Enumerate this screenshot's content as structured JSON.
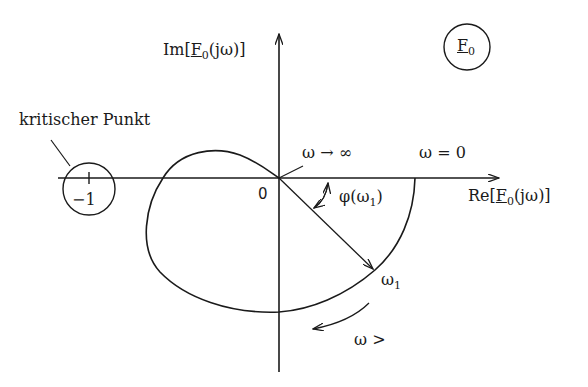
{
  "diagram": {
    "title_symbol": {
      "main": "F",
      "sub": "0"
    },
    "axes": {
      "imag_label": {
        "prefix": "Im[",
        "F": "F",
        "sub": "0",
        "suffix": "(jω)]"
      },
      "real_label": {
        "prefix": "Re[",
        "F": "F",
        "sub": "0",
        "suffix": "(jω)]"
      },
      "origin_label": "0"
    },
    "critical_point": {
      "caption": "kritischer Punkt",
      "value": "−1"
    },
    "annotations": {
      "omega_infinity": "ω → ∞",
      "omega_zero": "ω = 0",
      "phase": {
        "prefix": "φ(ω",
        "sub": "1",
        "suffix": ")"
      },
      "omega1": {
        "main": "ω",
        "sub": "1"
      },
      "omega_increasing": "ω >"
    },
    "colors": {
      "stroke": "#1a1a1a",
      "background": "#ffffff"
    }
  }
}
